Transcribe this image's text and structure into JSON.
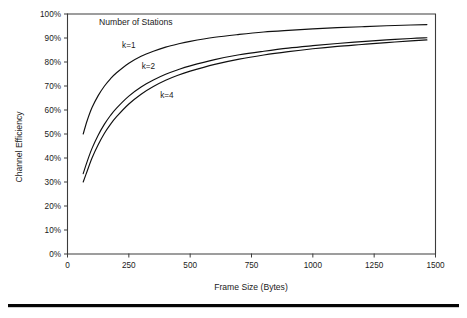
{
  "figure": {
    "background_color": "#ffffff",
    "axis_color": "#3c3c3c",
    "curve_color": "#101010",
    "rule_color": "#050505",
    "bottom_rule_name": "horizontal-rule"
  },
  "chart_data": {
    "type": "line",
    "title": "",
    "annotation_title": "Number of Stations",
    "xlabel": "Frame Size (Bytes)",
    "ylabel": "Channel Efficiency",
    "xlim": [
      0,
      1500
    ],
    "ylim": [
      0,
      100
    ],
    "grid": false,
    "legend_position": "inline-annotations",
    "xticks": [
      0,
      250,
      500,
      750,
      1000,
      1250,
      1500
    ],
    "xtick_labels": [
      "0",
      "250",
      "500",
      "750",
      "1000",
      "1250",
      "1500"
    ],
    "yticks": [
      0,
      10,
      20,
      30,
      40,
      50,
      60,
      70,
      80,
      90,
      100
    ],
    "ytick_labels": [
      "0%",
      "10%",
      "20%",
      "30%",
      "40%",
      "50%",
      "60%",
      "70%",
      "80%",
      "90%",
      "100%"
    ],
    "series": [
      {
        "name": "k=1",
        "label": "k=1",
        "label_x": 250,
        "label_y": 86,
        "x": [
          64,
          80,
          100,
          125,
          150,
          175,
          200,
          250,
          300,
          350,
          400,
          450,
          500,
          600,
          700,
          800,
          900,
          1000,
          1100,
          1200,
          1300,
          1400,
          1465
        ],
        "values": [
          50.0,
          55.5,
          61.0,
          66.0,
          69.9,
          73.0,
          75.5,
          79.5,
          82.4,
          84.5,
          86.2,
          87.5,
          88.6,
          90.3,
          91.5,
          92.5,
          93.2,
          93.8,
          94.3,
          94.7,
          95.1,
          95.4,
          95.6
        ]
      },
      {
        "name": "k=2",
        "label": "k=2",
        "label_x": 330,
        "label_y": 77,
        "x": [
          64,
          80,
          100,
          125,
          150,
          175,
          200,
          250,
          300,
          350,
          400,
          450,
          500,
          600,
          700,
          800,
          900,
          1000,
          1100,
          1200,
          1300,
          1400,
          1465
        ],
        "values": [
          33.5,
          38.5,
          44.0,
          49.5,
          54.0,
          57.7,
          60.8,
          65.8,
          69.6,
          72.5,
          74.9,
          76.8,
          78.4,
          81.0,
          83.0,
          84.5,
          85.8,
          86.8,
          87.7,
          88.5,
          89.2,
          89.8,
          90.1
        ]
      },
      {
        "name": "k=4",
        "label": "k=4",
        "label_x": 405,
        "label_y": 65,
        "x": [
          64,
          80,
          100,
          125,
          150,
          175,
          200,
          250,
          300,
          350,
          400,
          450,
          500,
          600,
          700,
          800,
          900,
          1000,
          1100,
          1200,
          1300,
          1400,
          1465
        ],
        "values": [
          30.0,
          34.5,
          40.0,
          45.5,
          50.2,
          54.0,
          57.2,
          62.5,
          66.6,
          69.8,
          72.4,
          74.5,
          76.2,
          79.0,
          81.2,
          82.9,
          84.3,
          85.5,
          86.5,
          87.3,
          88.1,
          88.8,
          89.2
        ]
      }
    ]
  }
}
